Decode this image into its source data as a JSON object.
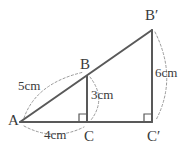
{
  "figure": {
    "type": "geometry-diagram",
    "colors": {
      "solid_line": "#595959",
      "dashed_arc": "#9a9a9a",
      "text": "#3a3a3a",
      "background": "#ffffff"
    },
    "vertices": [
      {
        "id": "A",
        "label": "A",
        "x": 20,
        "y": 122
      },
      {
        "id": "B",
        "label": "B",
        "x": 87,
        "y": 76
      },
      {
        "id": "C",
        "label": "C",
        "x": 87,
        "y": 122
      },
      {
        "id": "Bp",
        "label": "B′",
        "x": 152,
        "y": 30
      },
      {
        "id": "Cp",
        "label": "C′",
        "x": 152,
        "y": 122
      }
    ],
    "segments": [
      {
        "name": "hypotenuse-A-Bprime",
        "from": "A",
        "to": "Bp"
      },
      {
        "name": "base-A-Cprime",
        "from": "A",
        "to": "Cp"
      },
      {
        "name": "altitude-B-C",
        "from": "B",
        "to": "C"
      },
      {
        "name": "altitude-Bprime-Cprime",
        "from": "Bp",
        "to": "Cp"
      }
    ],
    "right_angles": [
      {
        "name": "right-angle-at-C",
        "x": 87,
        "y": 122
      },
      {
        "name": "right-angle-at-Cprime",
        "x": 152,
        "y": 122
      }
    ],
    "measurements": [
      {
        "name": "measure-AB",
        "label": "5cm",
        "segment": "A-B",
        "arc_side": "outer-left"
      },
      {
        "name": "measure-AC",
        "label": "4cm",
        "segment": "A-C",
        "arc_side": "below"
      },
      {
        "name": "measure-BC",
        "label": "3cm",
        "segment": "B-C",
        "arc_side": "right"
      },
      {
        "name": "measure-BpCp",
        "label": "6cm",
        "segment": "B'-C'",
        "arc_side": "right"
      }
    ]
  },
  "labels": {
    "A": "A",
    "B": "B",
    "C": "C",
    "Bprime": "B′",
    "Cprime": "C′",
    "five_cm": "5cm",
    "four_cm": "4cm",
    "three_cm": "3cm",
    "six_cm": "6cm"
  }
}
